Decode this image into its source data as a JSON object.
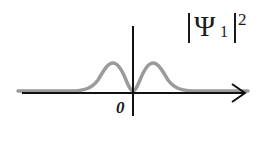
{
  "diagram": {
    "title_label": {
      "psi": "Ψ",
      "subscript": "1",
      "superscript": "2"
    },
    "origin_label": "0",
    "colors": {
      "axis": "#111111",
      "curve": "#9a9a9a",
      "text": "#1a1a1a"
    },
    "curve": {
      "description": "probability density |Ψ1|^2 with two symmetric peaks and a node at 0",
      "peaks_x_relative": [
        -1,
        1
      ],
      "node_at": 0
    }
  }
}
